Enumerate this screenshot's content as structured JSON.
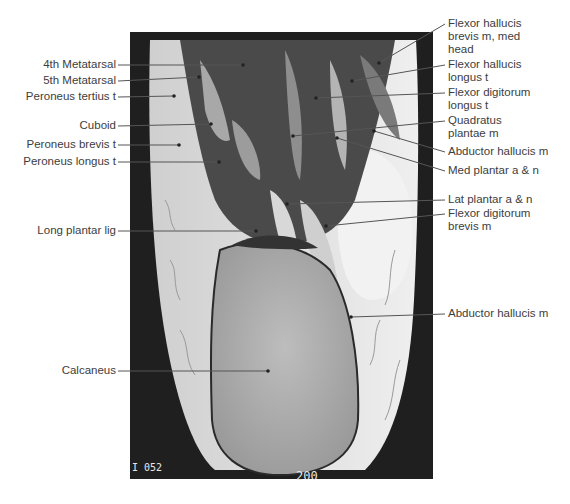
{
  "figure": {
    "type": "annotated MRI, coronal section of hindfoot",
    "image_overlay": {
      "bottom_left_code": "I 052",
      "bottom_left_code2": "E 05",
      "bottom_right_code": "200"
    },
    "left_labels": [
      {
        "text": "4th Metatarsal",
        "x": 116,
        "y": 65,
        "tx": 243,
        "ty": 65
      },
      {
        "text": "5th Metatarsal",
        "x": 116,
        "y": 81,
        "tx": 199,
        "ty": 77
      },
      {
        "text": "Peroneus tertius t",
        "x": 116,
        "y": 97,
        "tx": 174,
        "ty": 96
      },
      {
        "text": "Cuboid",
        "x": 116,
        "y": 126,
        "tx": 211,
        "ty": 124
      },
      {
        "text": "Peroneus brevis t",
        "x": 116,
        "y": 145,
        "tx": 179,
        "ty": 145
      },
      {
        "text": "Peroneus longus t",
        "x": 116,
        "y": 162,
        "tx": 219,
        "ty": 162
      },
      {
        "text": "Long plantar lig",
        "x": 116,
        "y": 231,
        "tx": 256,
        "ty": 231
      },
      {
        "text": "Calcaneus",
        "x": 116,
        "y": 371,
        "tx": 268,
        "ty": 371
      }
    ],
    "right_labels": [
      {
        "text": "Flexor hallucis\nbrevis m, med\nhead",
        "x": 448,
        "y": 24,
        "lines": 3,
        "tx": 379,
        "ty": 63
      },
      {
        "text": "Flexor hallucis\nlongus t",
        "x": 448,
        "y": 65,
        "lines": 2,
        "tx": 352,
        "ty": 81
      },
      {
        "text": "Flexor digitorum\nlongus t",
        "x": 448,
        "y": 93,
        "lines": 2,
        "tx": 316,
        "ty": 98
      },
      {
        "text": "Quadratus\nplantae m",
        "x": 448,
        "y": 121,
        "lines": 2,
        "tx": 293,
        "ty": 136
      },
      {
        "text": "Abductor hallucis m",
        "x": 448,
        "y": 152,
        "lines": 1,
        "tx": 374,
        "ty": 131
      },
      {
        "text": "Med plantar a & n",
        "x": 448,
        "y": 171,
        "lines": 1,
        "tx": 337,
        "ty": 138
      },
      {
        "text": "Lat plantar a & n",
        "x": 448,
        "y": 200,
        "lines": 1,
        "tx": 287,
        "ty": 204
      },
      {
        "text": "Flexor digitorum\nbrevis m",
        "x": 448,
        "y": 214,
        "lines": 2,
        "tx": 326,
        "ty": 226
      },
      {
        "text": "Abductor hallucis m",
        "x": 448,
        "y": 314,
        "lines": 1,
        "tx": 351,
        "ty": 317
      }
    ],
    "colors": {
      "label_text": "#3d3d3d",
      "leader_line": "#555555",
      "mri_background": "#1e1e1e"
    }
  }
}
